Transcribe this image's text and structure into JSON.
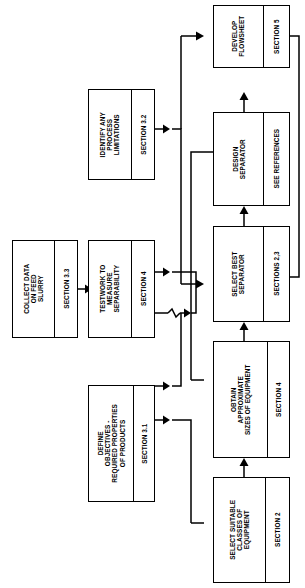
{
  "diagram": {
    "orientation": "rotated-90-ccw",
    "line_color": "#000000",
    "background_color": "#ffffff",
    "nodes": [
      {
        "id": "develop-flowsheet",
        "title": "DEVELOP\nFLOWSHEET",
        "section": "SECTION 5"
      },
      {
        "id": "design-separator",
        "title": "DESIGN\nSEPARATOR",
        "section": "SEE REFERENCES"
      },
      {
        "id": "select-best-separator",
        "title": "SELECT BEST\nSEPARATOR",
        "section": "SECTIONS 2,3"
      },
      {
        "id": "obtain-approximate-sizes",
        "title": "OBTAIN\nAPPROXIMATE\nSIZES OF EQUIPMENT",
        "section": "SECTION 4"
      },
      {
        "id": "select-suitable-classes",
        "title": "SELECT SUITABLE\nCLASSES OF\nEQUIPMENT",
        "section": "SECTION 2"
      },
      {
        "id": "identify-process-limitations",
        "title": "IDENTIFY ANY\nPROCESS\nLIMITATIONS",
        "section": "SECTION 3.2"
      },
      {
        "id": "testwork-separability",
        "title": "TESTWORK TO\nMEASURE\nSEPARABILITY",
        "section": "SECTION 4"
      },
      {
        "id": "define-objectives",
        "title": "DEFINE\nOBJECTIVES -\nREQUIRED PROPERTIES\nOF PRODUCTS",
        "section": "SECTION 3.1"
      },
      {
        "id": "collect-data-feed-slurry",
        "title": "COLLECT DATA\nON FEED\nSLURRY",
        "section": "SECTION 3.3"
      }
    ],
    "edges": [
      {
        "from": "collect-data-feed-slurry",
        "to": "testwork-separability"
      },
      {
        "from": "identify-process-limitations",
        "to": "select-best-separator"
      },
      {
        "from": "testwork-separability",
        "to": "select-best-separator"
      },
      {
        "from": "define-objectives",
        "to": "select-best-separator"
      },
      {
        "from": "define-objectives",
        "to": "select-suitable-classes"
      },
      {
        "from": "select-suitable-classes",
        "to": "obtain-approximate-sizes"
      },
      {
        "from": "obtain-approximate-sizes",
        "to": "select-best-separator"
      },
      {
        "from": "select-best-separator",
        "to": "design-separator"
      },
      {
        "from": "design-separator",
        "to": "obtain-approximate-sizes"
      },
      {
        "from": "design-separator",
        "to": "develop-flowsheet"
      },
      {
        "from": "develop-flowsheet",
        "to": "select-best-separator"
      }
    ]
  }
}
